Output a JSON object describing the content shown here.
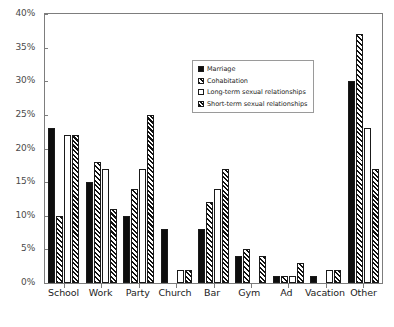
{
  "chart_data": {
    "type": "bar",
    "title": "",
    "subtitle": "",
    "xlabel": "",
    "ylabel": "",
    "ylim": [
      0,
      40
    ],
    "y_tick_labels": [
      "0%",
      "5%",
      "10%",
      "15%",
      "20%",
      "25%",
      "30%",
      "35%",
      "40%"
    ],
    "y_tick_values": [
      0,
      5,
      10,
      15,
      20,
      25,
      30,
      35,
      40
    ],
    "grid": false,
    "legend_position": "inside-top-center",
    "categories": [
      "School",
      "Work",
      "Party",
      "Church",
      "Bar",
      "Gym",
      "Ad",
      "Vacation",
      "Other"
    ],
    "series": [
      {
        "name": "Marriage",
        "fill": "solid-black",
        "color": "#0d0d0d",
        "values": [
          23,
          15,
          10,
          8,
          8,
          4,
          1,
          1,
          30
        ]
      },
      {
        "name": "Cohabitation",
        "fill": "diagonal-hatch",
        "color": "#111111",
        "values": [
          10,
          18,
          14,
          0,
          12,
          5,
          1,
          0,
          37
        ]
      },
      {
        "name": "Long-term sexual relationships",
        "fill": "white-empty",
        "color": "#ffffff",
        "values": [
          22,
          17,
          17,
          2,
          14,
          0,
          1,
          2,
          23
        ]
      },
      {
        "name": "Short-term sexual relationships",
        "fill": "diagonal-hatch-dense",
        "color": "#111111",
        "values": [
          22,
          11,
          25,
          2,
          17,
          4,
          3,
          2,
          17
        ]
      }
    ]
  },
  "legend": {
    "items": [
      {
        "label": "Marriage"
      },
      {
        "label": "Cohabitation"
      },
      {
        "label": "Long-term sexual relationships"
      },
      {
        "label": "Short-term sexual relationships"
      }
    ]
  }
}
